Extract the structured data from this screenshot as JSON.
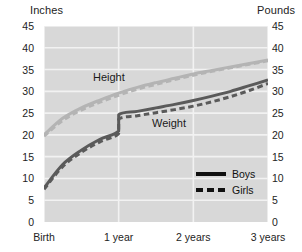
{
  "chart_data": {
    "type": "line",
    "title": "",
    "subtitle": "",
    "left_axis": {
      "label": "Inches",
      "ticks": [
        45,
        40,
        35,
        30,
        25,
        20,
        15,
        10,
        5,
        0
      ],
      "range": [
        0,
        45
      ]
    },
    "right_axis": {
      "label": "Pounds",
      "ticks": [
        45,
        40,
        35,
        30,
        25,
        20,
        15,
        10,
        5,
        0
      ],
      "range": [
        0,
        45
      ]
    },
    "xlabel": "",
    "x_ticks": [
      "Birth",
      "1 year",
      "2 years",
      "3 years"
    ],
    "x_values": [
      0,
      1,
      2,
      3
    ],
    "grid": true,
    "legend_position": "inside-bottom-right",
    "legend": [
      {
        "name": "Boys",
        "style": "solid"
      },
      {
        "name": "Girls",
        "style": "dashed"
      }
    ],
    "annotations": [
      {
        "text": "Height",
        "x": 0.85,
        "y": 33
      },
      {
        "text": "Weight",
        "x": 2.0,
        "y": 23
      }
    ],
    "series": [
      {
        "name": "Height - Boys",
        "measure": "Height",
        "group": "Boys",
        "axis": "left",
        "unit": "inches",
        "style": "solid",
        "color": "#b4b4b4",
        "x": [
          0,
          0.25,
          0.5,
          0.75,
          1,
          1.25,
          1.5,
          1.75,
          2,
          2.25,
          2.5,
          2.75,
          3
        ],
        "values": [
          20.0,
          23.8,
          26.2,
          28.0,
          29.6,
          30.9,
          32.0,
          33.0,
          34.0,
          34.8,
          35.6,
          36.4,
          37.2
        ]
      },
      {
        "name": "Height - Girls",
        "measure": "Height",
        "group": "Girls",
        "axis": "left",
        "unit": "inches",
        "style": "dashed",
        "color": "#b4b4b4",
        "x": [
          0,
          0.25,
          0.5,
          0.75,
          1,
          1.25,
          1.5,
          1.75,
          2,
          2.25,
          2.5,
          2.75,
          3
        ],
        "values": [
          19.7,
          23.3,
          25.7,
          27.5,
          29.1,
          30.5,
          31.6,
          32.7,
          33.7,
          34.6,
          35.4,
          36.2,
          37.0
        ]
      },
      {
        "name": "Weight - Boys",
        "measure": "Weight",
        "group": "Boys",
        "axis": "right",
        "unit": "pounds",
        "style": "solid",
        "color": "#5a5a5a",
        "x": [
          0,
          0.25,
          0.5,
          0.75,
          1,
          1,
          1.25,
          1.5,
          1.75,
          2,
          2.25,
          2.5,
          2.75,
          3
        ],
        "values": [
          7.8,
          13.2,
          16.5,
          19.0,
          20.9,
          24.6,
          25.4,
          26.2,
          27.0,
          27.9,
          28.9,
          30.0,
          31.3,
          32.6
        ]
      },
      {
        "name": "Weight - Girls",
        "measure": "Weight",
        "group": "Girls",
        "axis": "right",
        "unit": "pounds",
        "style": "dashed",
        "color": "#5a5a5a",
        "x": [
          0,
          0.25,
          0.5,
          0.75,
          1,
          1,
          1.25,
          1.5,
          1.75,
          2,
          2.25,
          2.5,
          2.75,
          3
        ],
        "values": [
          7.5,
          12.7,
          16.0,
          18.4,
          20.3,
          23.6,
          24.4,
          25.1,
          25.8,
          26.6,
          27.6,
          28.8,
          30.2,
          31.8
        ]
      }
    ],
    "colors": {
      "plot_background": "#d8d8d8",
      "grid": "#f2f2f2",
      "height_series": "#b4b4b4",
      "weight_series": "#5a5a5a",
      "text": "#232323"
    }
  }
}
